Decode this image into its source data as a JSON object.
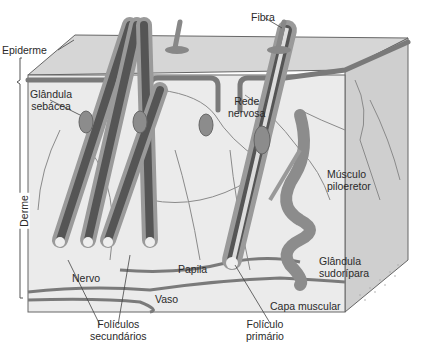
{
  "diagram": {
    "colors": {
      "background": "#ffffff",
      "block_fill": "#e4e4e4",
      "side_face": "#c8c8c8",
      "epidermis_band": "#7a7a7a",
      "structure_dark": "#555555",
      "structure_mid": "#8c8c8c",
      "line": "#666666",
      "text": "#2a2a2a"
    },
    "labels": {
      "fibra": "Fibra",
      "epiderme": "Epiderme",
      "glandula_sebacea_1": "Glândula",
      "glandula_sebacea_2": "sebácea",
      "rede_nervosa_1": "Rede",
      "rede_nervosa_2": "nervosa",
      "musculo_piloeretor_1": "Músculo",
      "musculo_piloeretor_2": "piloeretor",
      "derme": "Derme",
      "glandula_sudoripara_1": "Glândula",
      "glandula_sudoripara_2": "sudorípara",
      "nervo": "Nervo",
      "papila": "Papila",
      "vaso": "Vaso",
      "capa_muscular": "Capa muscular",
      "foliculos_secundarios_1": "Folículos",
      "foliculos_secundarios_2": "secundários",
      "foliculo_primario_1": "Folículo",
      "foliculo_primario_2": "primário"
    }
  }
}
